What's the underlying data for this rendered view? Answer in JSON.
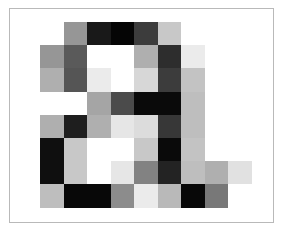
{
  "figure": {
    "type": "pixel-grid-image",
    "title": "",
    "background_color": "#ffffff",
    "frame": {
      "border_color": "#b9b9b9",
      "border_width": 1,
      "x": 9,
      "y": 8,
      "width": 265,
      "height": 215
    },
    "grid": {
      "columns": 9,
      "rows": 8,
      "cell_width": 23.5,
      "cell_height": 23.2,
      "origin_x": 40,
      "origin_y": 22
    }
  },
  "chart_data": {
    "type": "heatmap",
    "title": "",
    "xlabel": "",
    "ylabel": "",
    "colormap": "gray",
    "vmin": 0,
    "vmax": 255,
    "rows": 8,
    "cols": 9,
    "values": [
      [
        255,
        150,
        25,
        5,
        60,
        200,
        255,
        255,
        255
      ],
      [
        150,
        90,
        255,
        255,
        175,
        45,
        235,
        255,
        255
      ],
      [
        175,
        85,
        235,
        255,
        215,
        60,
        195,
        255,
        255
      ],
      [
        255,
        255,
        165,
        75,
        10,
        10,
        190,
        255,
        255
      ],
      [
        175,
        30,
        175,
        230,
        220,
        55,
        190,
        255,
        255
      ],
      [
        15,
        200,
        255,
        255,
        200,
        10,
        195,
        255,
        255
      ],
      [
        15,
        200,
        255,
        230,
        130,
        35,
        190,
        175,
        225
      ],
      [
        190,
        8,
        8,
        140,
        235,
        185,
        8,
        120,
        255
      ]
    ],
    "hex_values": [
      [
        "#ffffff",
        "#969696",
        "#191919",
        "#050505",
        "#3c3c3c",
        "#c8c8c8",
        "#ffffff",
        "#ffffff",
        "#ffffff"
      ],
      [
        "#969696",
        "#5a5a5a",
        "#ffffff",
        "#ffffff",
        "#afafaf",
        "#2d2d2d",
        "#ebebeb",
        "#ffffff",
        "#ffffff"
      ],
      [
        "#afafaf",
        "#555555",
        "#ebebeb",
        "#ffffff",
        "#d7d7d7",
        "#3c3c3c",
        "#c3c3c3",
        "#ffffff",
        "#ffffff"
      ],
      [
        "#ffffff",
        "#ffffff",
        "#a5a5a5",
        "#4b4b4b",
        "#0a0a0a",
        "#0a0a0a",
        "#bebebe",
        "#ffffff",
        "#ffffff"
      ],
      [
        "#afafaf",
        "#1e1e1e",
        "#afafaf",
        "#e6e6e6",
        "#dcdcdc",
        "#373737",
        "#bebebe",
        "#ffffff",
        "#ffffff"
      ],
      [
        "#0f0f0f",
        "#c8c8c8",
        "#ffffff",
        "#ffffff",
        "#c8c8c8",
        "#0a0a0a",
        "#c3c3c3",
        "#ffffff",
        "#ffffff"
      ],
      [
        "#0f0f0f",
        "#c8c8c8",
        "#ffffff",
        "#e6e6e6",
        "#828282",
        "#232323",
        "#bebebe",
        "#afafaf",
        "#e1e1e1"
      ],
      [
        "#bebebe",
        "#080808",
        "#080808",
        "#8c8c8c",
        "#ebebeb",
        "#b9b9b9",
        "#080808",
        "#787878",
        "#ffffff"
      ]
    ]
  }
}
